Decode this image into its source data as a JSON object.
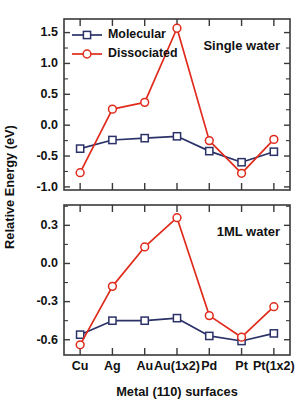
{
  "figure": {
    "axis_title_x": "Metal (110) surfaces",
    "axis_title_y": "Relative Energy (eV)"
  },
  "legend": {
    "molecular_label": "Molecular",
    "dissociated_label": "Dissociated"
  },
  "colors": {
    "molecular": "#2b3268",
    "dissociated": "#e02a1c",
    "axis": "#3a3a3a",
    "text": "#111111",
    "background": "#ffffff"
  },
  "chart_data": [
    {
      "type": "line",
      "title": "Single water",
      "xlabel": "",
      "ylabel": "Relative Energy (eV)",
      "categories": [
        "Cu",
        "Ag",
        "Au",
        "Au(1x2)",
        "Pd",
        "Pt",
        "Pt(1x2)"
      ],
      "yticks": [
        1.5,
        1.0,
        0.5,
        0.0,
        -0.5,
        -1.0
      ],
      "ylim": [
        -1.05,
        1.72
      ],
      "grid": false,
      "legend_position": "top-left",
      "series": [
        {
          "name": "Molecular",
          "values": [
            -0.38,
            -0.24,
            -0.21,
            -0.18,
            -0.42,
            -0.6,
            -0.43
          ]
        },
        {
          "name": "Dissociated",
          "values": [
            -0.77,
            0.26,
            0.37,
            1.57,
            -0.25,
            -0.78,
            -0.23
          ]
        }
      ]
    },
    {
      "type": "line",
      "title": "1ML water",
      "xlabel": "Metal (110) surfaces",
      "ylabel": "Relative Energy (eV)",
      "categories": [
        "Cu",
        "Ag",
        "Au",
        "Au(1x2)",
        "Pd",
        "Pt",
        "Pt(1x2)"
      ],
      "yticks": [
        0.3,
        0.0,
        -0.3,
        -0.6
      ],
      "ylim": [
        -0.72,
        0.46
      ],
      "grid": false,
      "legend_position": "none",
      "series": [
        {
          "name": "Molecular",
          "values": [
            -0.56,
            -0.45,
            -0.45,
            -0.43,
            -0.57,
            -0.61,
            -0.55
          ]
        },
        {
          "name": "Dissociated",
          "values": [
            -0.64,
            -0.18,
            0.13,
            0.36,
            -0.41,
            -0.58,
            -0.34
          ]
        }
      ]
    }
  ]
}
